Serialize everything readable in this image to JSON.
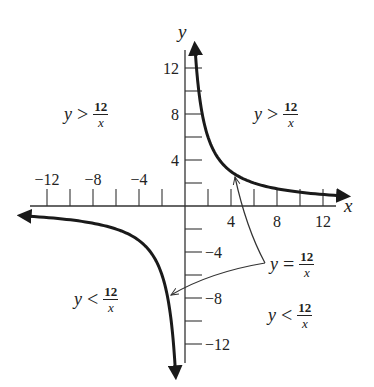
{
  "chart_data": {
    "type": "line",
    "title": "",
    "function": "y = 12/x",
    "xlabel": "x",
    "ylabel": "y",
    "xlim": [
      -13.5,
      13.5
    ],
    "ylim": [
      -13.5,
      13.5
    ],
    "grid": false,
    "x_tick_step": 2,
    "y_tick_step": 2,
    "x_tick_labels": [
      {
        "value": -12,
        "label": "−12"
      },
      {
        "value": -8,
        "label": "−8"
      },
      {
        "value": -4,
        "label": "−4"
      },
      {
        "value": 4,
        "label": "4"
      },
      {
        "value": 8,
        "label": "8"
      },
      {
        "value": 12,
        "label": "12"
      }
    ],
    "y_tick_labels": [
      {
        "value": 12,
        "label": "12"
      },
      {
        "value": 8,
        "label": "8"
      },
      {
        "value": 4,
        "label": "4"
      },
      {
        "value": -4,
        "label": "−4"
      },
      {
        "value": -8,
        "label": "−8"
      },
      {
        "value": -12,
        "label": "−12"
      }
    ],
    "series": [
      {
        "name": "y = 12/x (x > 0 branch)",
        "x": [
          0.9,
          1,
          1.5,
          2,
          3,
          4,
          6,
          8,
          10,
          12,
          13.4
        ],
        "y": [
          13.33,
          12,
          8,
          6,
          4,
          3,
          2,
          1.5,
          1.2,
          1,
          0.9
        ]
      },
      {
        "name": "y = 12/x (x < 0 branch)",
        "x": [
          -13.6,
          -12,
          -10,
          -8,
          -6,
          -4,
          -3,
          -2,
          -1.5,
          -1,
          -0.85
        ],
        "y": [
          -0.88,
          -1,
          -1.2,
          -1.5,
          -2,
          -3,
          -4,
          -6,
          -8,
          -12,
          -14.1
        ]
      }
    ],
    "annotations": [
      {
        "text": "y > 12/x",
        "region": "upper-left",
        "lhs": "y",
        "rel": ">",
        "num": "12",
        "den": "x"
      },
      {
        "text": "y > 12/x",
        "region": "upper-right",
        "lhs": "y",
        "rel": ">",
        "num": "12",
        "den": "x"
      },
      {
        "text": "y < 12/x",
        "region": "lower-left",
        "lhs": "y",
        "rel": "<",
        "num": "12",
        "den": "x"
      },
      {
        "text": "y < 12/x",
        "region": "lower-right",
        "lhs": "y",
        "rel": "<",
        "num": "12",
        "den": "x"
      },
      {
        "text": "y = 12/x",
        "region": "curve-label",
        "lhs": "y",
        "rel": "=",
        "num": "12",
        "den": "x",
        "points_to": [
          [
            4.3,
            2.8
          ],
          [
            -1.3,
            -7.7
          ]
        ]
      }
    ]
  },
  "style": {
    "curve_color": "#1a1a1a",
    "axis_color": "#333333"
  }
}
